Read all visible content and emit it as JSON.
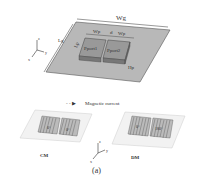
{
  "figure": {
    "top": {
      "ground_width_label": "Wg",
      "ground_length_label": "Lg",
      "patch_width_label_left": "Wp",
      "gap_label": "d",
      "patch_width_label_right": "Wp",
      "patch_length_label": "Lp",
      "patch_height_label": "Hp",
      "port1_label": "Pport1",
      "port2_label": "Pport2",
      "axes": {
        "z": "z",
        "y": "y",
        "x": "x"
      }
    },
    "legend": {
      "symbol": "- - ▶",
      "text": "Magnetic current"
    },
    "bottom": {
      "cm": {
        "label": "CM",
        "phase_left": "0°",
        "phase_right": "0°"
      },
      "dm": {
        "label": "DM",
        "phase_left": "0°",
        "phase_right": "180°"
      },
      "axes": {
        "z": "z",
        "y": "y",
        "x": "x"
      }
    },
    "caption": "(a)"
  }
}
